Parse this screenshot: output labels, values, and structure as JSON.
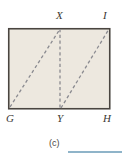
{
  "figure": {
    "type": "geometry-diagram",
    "shape": "rectangle",
    "caption": "(c)",
    "fill_color": "#ede8df",
    "border_color": "#4a4540",
    "dashed_color": "#8a8a90",
    "answer_rule_color": "#8fb4c9",
    "rectangle": {
      "x": 8,
      "y": 28,
      "width": 102,
      "height": 81
    },
    "vertices": [
      {
        "id": "X",
        "label": "X",
        "x": 60,
        "y": 28,
        "position": "top-middle"
      },
      {
        "id": "I",
        "label": "I",
        "x": 110,
        "y": 28,
        "position": "top-right"
      },
      {
        "id": "G",
        "label": "G",
        "x": 8,
        "y": 109,
        "position": "bottom-left"
      },
      {
        "id": "Y",
        "label": "Y",
        "x": 60,
        "y": 109,
        "position": "bottom-middle"
      },
      {
        "id": "H",
        "label": "H",
        "x": 110,
        "y": 109,
        "position": "bottom-right"
      }
    ],
    "dashed_segments": [
      {
        "id": "GX",
        "from": "G",
        "to": "X",
        "x1": 10,
        "y1": 107,
        "x2": 60,
        "y2": 29
      },
      {
        "id": "XY",
        "from": "X",
        "to": "Y",
        "x1": 60,
        "y1": 29,
        "x2": 60,
        "y2": 108
      },
      {
        "id": "YI",
        "from": "Y",
        "to": "I",
        "x1": 61,
        "y1": 108,
        "x2": 109,
        "y2": 29
      }
    ]
  },
  "answer_blank": {
    "label": ""
  }
}
